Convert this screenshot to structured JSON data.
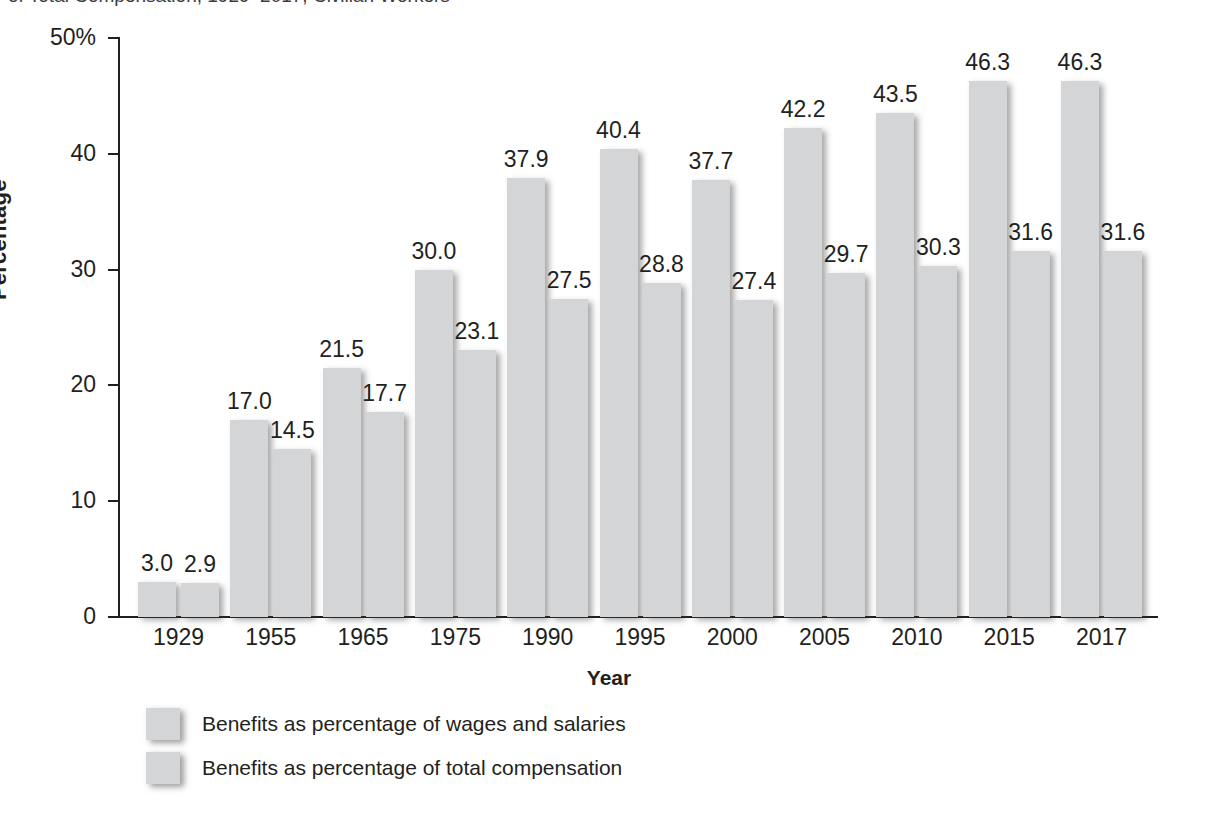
{
  "chart_data": {
    "type": "bar",
    "title": "of Total Compensation, 1929–2017, Civilian Workers",
    "xlabel": "Year",
    "ylabel": "Percentage",
    "ylim": [
      0,
      50
    ],
    "yticks": [
      "0",
      "10",
      "20",
      "30",
      "40",
      "50%"
    ],
    "ytick_values": [
      0,
      10,
      20,
      30,
      40,
      50
    ],
    "grid": false,
    "legend_position": "bottom-left",
    "categories": [
      "1929",
      "1955",
      "1965",
      "1975",
      "1990",
      "1995",
      "2000",
      "2005",
      "2010",
      "2015",
      "2017"
    ],
    "series": [
      {
        "name": "Benefits as percentage of wages and salaries",
        "values": [
          3.0,
          17.0,
          21.5,
          30.0,
          37.9,
          40.4,
          37.7,
          42.2,
          43.5,
          46.3,
          46.3
        ],
        "labels": [
          "3.0",
          "17.0",
          "21.5",
          "30.0",
          "37.9",
          "40.4",
          "37.7",
          "42.2",
          "43.5",
          "46.3",
          "46.3"
        ],
        "color": "#d4d5d6"
      },
      {
        "name": "Benefits as percentage of total compensation",
        "values": [
          2.9,
          14.5,
          17.7,
          23.1,
          27.5,
          28.8,
          27.4,
          29.7,
          30.3,
          31.6,
          31.6
        ],
        "labels": [
          "2.9",
          "14.5",
          "17.7",
          "23.1",
          "27.5",
          "28.8",
          "27.4",
          "29.7",
          "30.3",
          "31.6",
          "31.6"
        ],
        "color": "#d4d5d6"
      }
    ]
  }
}
